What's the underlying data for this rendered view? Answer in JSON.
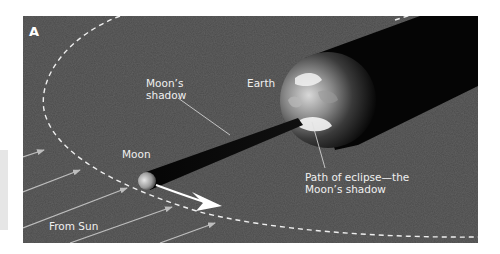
{
  "figure": {
    "panel_letter": "A",
    "colors": {
      "background": "#ffffff",
      "panel": "#4b4b4b",
      "shadow": "#050505",
      "orbit": "#eeeeee",
      "sunlight_arrows": "#bdbdbd",
      "labels": "#f0f0f0"
    },
    "labels": {
      "moons_shadow_line1": "Moon’s",
      "moons_shadow_line2": "shadow",
      "earth": "Earth",
      "moon": "Moon",
      "path_line1": "Path of eclipse—the",
      "path_line2": "Moon’s shadow",
      "from_sun": "From Sun"
    },
    "elements": [
      {
        "name": "earth",
        "description": "Earth globe, lit on the left"
      },
      {
        "name": "earth-shadow",
        "description": "Black shadow cylinder extending from Earth to upper right"
      },
      {
        "name": "moon",
        "description": "Small Moon on its orbit"
      },
      {
        "name": "moon-shadow",
        "description": "Dark shadow cone from Moon to Earth"
      },
      {
        "name": "moon-orbit",
        "description": "Dashed elliptical orbit of the Moon"
      },
      {
        "name": "orbit-direction-arrow",
        "description": "White arrow showing Moon's direction of motion"
      },
      {
        "name": "sunlight-arrows",
        "description": "Parallel arrows indicating sunlight from lower left",
        "count": 6
      }
    ]
  }
}
